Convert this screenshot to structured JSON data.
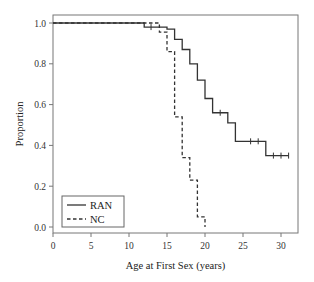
{
  "chart_data": {
    "type": "line",
    "subtype": "kaplan-meier step",
    "title": "",
    "xlabel": "Age at First Sex (years)",
    "ylabel": "Proportion",
    "xlim": [
      0,
      32
    ],
    "ylim": [
      0,
      1.05
    ],
    "xticks": [
      0,
      5,
      10,
      15,
      20,
      25,
      30
    ],
    "yticks": [
      0.0,
      0.2,
      0.4,
      0.6,
      0.8,
      1.0
    ],
    "ytick_labels": [
      "0.0",
      "0.2",
      "0.4",
      "0.6",
      "0.8",
      "1.0"
    ],
    "grid": false,
    "legend_position": "lower left",
    "series": [
      {
        "name": "RAN",
        "style": "solid",
        "color": "#333333",
        "steps": [
          {
            "x": 0,
            "y": 1.0
          },
          {
            "x": 12.0,
            "y": 0.98
          },
          {
            "x": 15.0,
            "y": 0.97
          },
          {
            "x": 16.0,
            "y": 0.92
          },
          {
            "x": 17.0,
            "y": 0.87
          },
          {
            "x": 18.0,
            "y": 0.8
          },
          {
            "x": 19.0,
            "y": 0.72
          },
          {
            "x": 20.0,
            "y": 0.63
          },
          {
            "x": 21.0,
            "y": 0.56
          },
          {
            "x": 23.0,
            "y": 0.51
          },
          {
            "x": 24.0,
            "y": 0.42
          },
          {
            "x": 28.0,
            "y": 0.35
          }
        ],
        "end_x": 31.0,
        "censored": [
          {
            "x": 12.9,
            "y": 0.98
          },
          {
            "x": 22.0,
            "y": 0.56
          },
          {
            "x": 26.0,
            "y": 0.42
          },
          {
            "x": 27.0,
            "y": 0.42
          },
          {
            "x": 29.0,
            "y": 0.35
          },
          {
            "x": 30.0,
            "y": 0.35
          },
          {
            "x": 31.0,
            "y": 0.35
          }
        ]
      },
      {
        "name": "NC",
        "style": "dashed",
        "color": "#333333",
        "steps": [
          {
            "x": 0,
            "y": 1.0
          },
          {
            "x": 14.0,
            "y": 0.955
          },
          {
            "x": 15.0,
            "y": 0.86
          },
          {
            "x": 16.0,
            "y": 0.54
          },
          {
            "x": 17.0,
            "y": 0.34
          },
          {
            "x": 18.0,
            "y": 0.23
          },
          {
            "x": 19.0,
            "y": 0.05
          },
          {
            "x": 20.0,
            "y": 0.0
          }
        ],
        "end_x": 20.0,
        "censored": []
      }
    ]
  },
  "legend": {
    "items": [
      {
        "label": "RAN",
        "style": "solid"
      },
      {
        "label": "NC",
        "style": "dashed"
      }
    ]
  },
  "axes": {
    "x_label": "Age at First Sex (years)",
    "y_label": "Proportion"
  }
}
